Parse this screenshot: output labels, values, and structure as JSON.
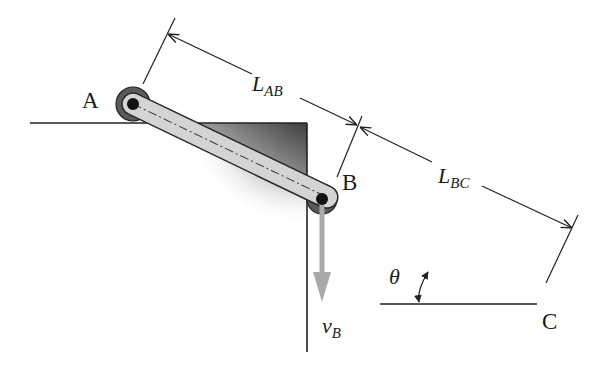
{
  "diagram": {
    "type": "mechanism",
    "points": {
      "A": {
        "label": "A",
        "x": 133,
        "y": 104
      },
      "B": {
        "label": "B",
        "x": 322,
        "y": 199
      },
      "C": {
        "label": "C",
        "x": 537,
        "y": 299
      }
    },
    "dimensions": {
      "L_AB": {
        "main": "L",
        "sub": "AB"
      },
      "L_BC": {
        "main": "L",
        "sub": "BC"
      }
    },
    "angle": {
      "label": "θ"
    },
    "velocity": {
      "main": "v",
      "sub": "B",
      "color": "#a9a9a9"
    },
    "colors": {
      "bar_fill": "#d4d4d4",
      "bar_stroke": "#2a2a2a",
      "pin_outer": "#5a5a5a",
      "pin_center": "#111111",
      "block_dark": "#3c3c3c",
      "line": "#222222"
    }
  }
}
